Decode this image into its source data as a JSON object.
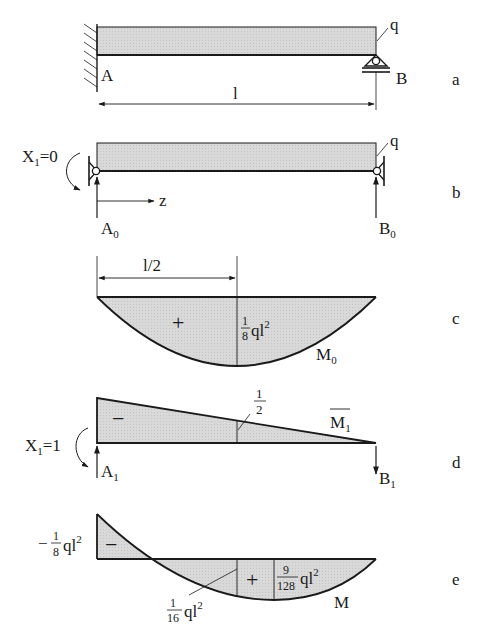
{
  "colors": {
    "fill": "#d6d6d6",
    "stroke": "#1a1a1a"
  },
  "panels": {
    "a": {
      "tag": "a",
      "load_label": "q",
      "support_a": "A",
      "support_b": "B",
      "span_label": "l"
    },
    "b": {
      "tag": "b",
      "load_label": "q",
      "moment_label": "X",
      "moment_sub": "1",
      "moment_value": "=0",
      "axis_label": "z",
      "reaction_a": "A",
      "reaction_a_sub": "0",
      "reaction_b": "B",
      "reaction_b_sub": "0"
    },
    "c": {
      "tag": "c",
      "half_span_label": "l/2",
      "sign": "+",
      "max_num": "1",
      "max_den": "8",
      "max_suffix": "ql",
      "max_exp": "2",
      "diagram_label": "M",
      "diagram_sub": "0"
    },
    "d": {
      "tag": "d",
      "sign": "−",
      "mid_num": "1",
      "mid_den": "2",
      "diagram_label": "M",
      "diagram_sub": "1",
      "moment_label": "X",
      "moment_sub": "1",
      "moment_value": "=1",
      "reaction_a": "A",
      "reaction_a_sub": "1",
      "reaction_b": "B",
      "reaction_b_sub": "1"
    },
    "e": {
      "tag": "e",
      "neg_prefix": "−",
      "neg_num": "1",
      "neg_den": "8",
      "neg_suffix": "ql",
      "neg_exp": "2",
      "sign_neg": "−",
      "sign_pos": "+",
      "mid_num": "1",
      "mid_den": "16",
      "mid_suffix": "ql",
      "mid_exp": "2",
      "max_num": "9",
      "max_den": "128",
      "max_suffix": "ql",
      "max_exp": "2",
      "diagram_label": "M"
    }
  }
}
